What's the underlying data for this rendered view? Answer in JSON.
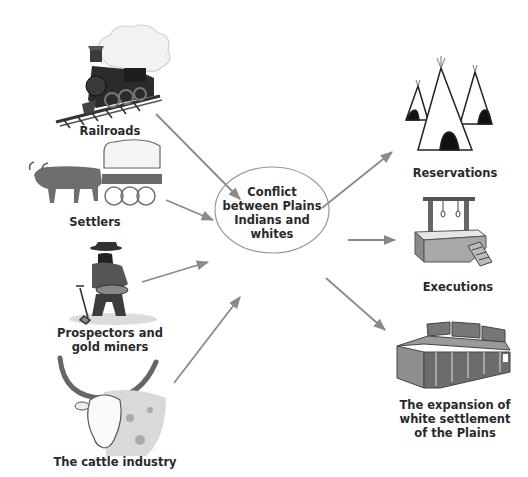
{
  "diagram": {
    "type": "cause-consequence",
    "center": {
      "lines": [
        "Conflict",
        "between Plains",
        "Indians and",
        "whites"
      ]
    },
    "causes": [
      {
        "id": "railroads",
        "lines": [
          "Railroads"
        ],
        "icon": "steam-locomotive-icon"
      },
      {
        "id": "settlers",
        "lines": [
          "Settlers"
        ],
        "icon": "ox-drawn-covered-wagon-icon"
      },
      {
        "id": "prospectors",
        "lines": [
          "Prospectors and",
          "gold miners"
        ],
        "icon": "gold-miner-panning-icon"
      },
      {
        "id": "cattle",
        "lines": [
          "The cattle industry"
        ],
        "icon": "longhorn-steer-icon"
      }
    ],
    "consequences": [
      {
        "id": "reservations",
        "lines": [
          "Reservations"
        ],
        "icon": "tipis-icon"
      },
      {
        "id": "executions",
        "lines": [
          "Executions"
        ],
        "icon": "gallows-icon"
      },
      {
        "id": "expansion",
        "lines": [
          "The expansion of",
          "white settlement",
          "of the Plains"
        ],
        "icon": "frontier-town-building-icon"
      }
    ],
    "colors": {
      "arrow": "#8a8a8a",
      "ellipse_stroke": "#9a9a9a",
      "text": "#2a2a2a"
    }
  }
}
